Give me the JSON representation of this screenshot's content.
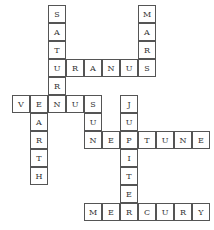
{
  "puzzle": {
    "title": "Planets crossword",
    "cell_size": 18,
    "origin": {
      "x": 12,
      "y": 5
    },
    "words": [
      {
        "word": "SATURN",
        "dir": "down",
        "col": 2,
        "row": 0
      },
      {
        "word": "MARS",
        "dir": "down",
        "col": 7,
        "row": 0
      },
      {
        "word": "URANUS",
        "dir": "across",
        "col": 2,
        "row": 3
      },
      {
        "word": "VENUS",
        "dir": "across",
        "col": 0,
        "row": 5
      },
      {
        "word": "EARTH",
        "dir": "down",
        "col": 1,
        "row": 5
      },
      {
        "word": "SUN",
        "dir": "down",
        "col": 4,
        "row": 5
      },
      {
        "word": "JUPITER",
        "dir": "down",
        "col": 6,
        "row": 5
      },
      {
        "word": "NEPTUNE",
        "dir": "across",
        "col": 4,
        "row": 7
      },
      {
        "word": "MERCURY",
        "dir": "across",
        "col": 4,
        "row": 11
      }
    ]
  }
}
